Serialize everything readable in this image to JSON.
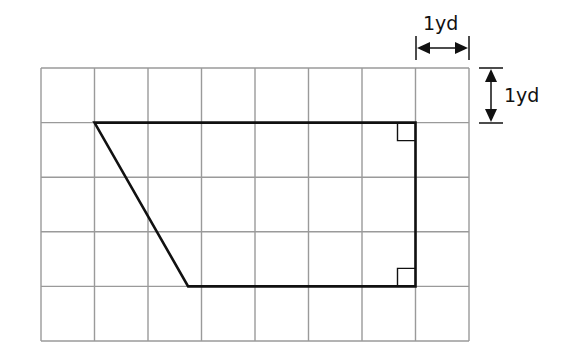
{
  "figure": {
    "grid": {
      "columns": 8,
      "rows": 5,
      "unit": "yd"
    },
    "scale_labels": {
      "horizontal": "1 yd",
      "vertical": "1 yd"
    },
    "shape": {
      "type": "trapezoid",
      "vertices_grid_units": [
        [
          1,
          1
        ],
        [
          7,
          1
        ],
        [
          7,
          4
        ],
        [
          2.75,
          4
        ]
      ],
      "right_angle_markers_at": [
        [
          7,
          1
        ],
        [
          7,
          4
        ]
      ]
    },
    "colors": {
      "grid": "#9a9a9a",
      "shape": "#111111",
      "background": "#ffffff"
    }
  }
}
